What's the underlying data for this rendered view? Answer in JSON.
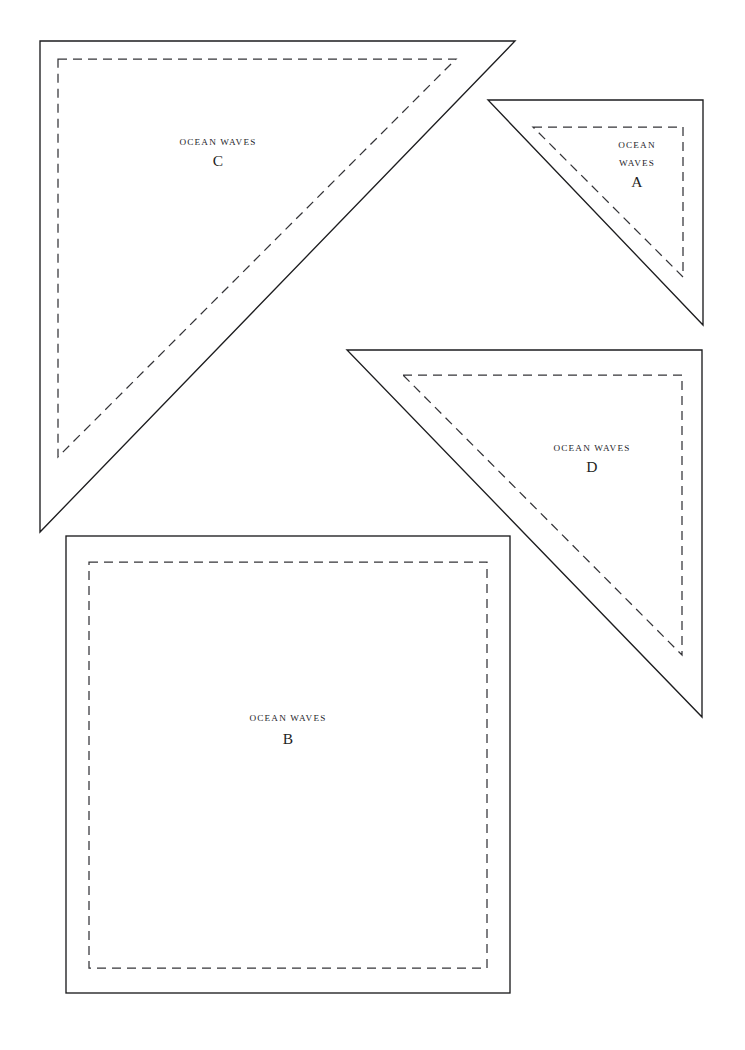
{
  "document": {
    "type": "quilt-template-sheet",
    "pattern_name": "OCEAN WAVES",
    "background_color": "#ffffff",
    "cut_line_color": "#1d1d1f",
    "seam_line_color": "#343438",
    "width": 745,
    "height": 1050
  },
  "pieces": [
    {
      "id": "C",
      "shape": "right-triangle",
      "pattern_label": "OCEAN WAVES",
      "letter": "C",
      "label_lines": [
        "OCEAN WAVES"
      ],
      "label_layout": "single-line",
      "orientation": "right-angle-top-left",
      "cut_points": "40,41 515,41 40,532",
      "seam_points": "58,59 456,59 58,457",
      "label_x": 218,
      "label_title_y": 145,
      "label_letter_y": 166
    },
    {
      "id": "A",
      "shape": "right-triangle",
      "pattern_label": "OCEAN WAVES",
      "letter": "A",
      "label_lines": [
        "OCEAN",
        "WAVES"
      ],
      "label_layout": "two-line",
      "orientation": "right-angle-top-right",
      "cut_points": "488,100 703,100 703,325",
      "seam_points": "533,127 683,127 683,277",
      "label_x": 637,
      "label_title_y": 148,
      "label_title_y2": 166,
      "label_letter_y": 187
    },
    {
      "id": "D",
      "shape": "right-triangle",
      "pattern_label": "OCEAN WAVES",
      "letter": "D",
      "label_lines": [
        "OCEAN WAVES"
      ],
      "label_layout": "single-line",
      "orientation": "right-angle-top-right",
      "cut_points": "347,350 702,350 702,717",
      "seam_points": "403,375 682,375 682,655",
      "label_x": 592,
      "label_title_y": 451,
      "label_letter_y": 472
    },
    {
      "id": "B",
      "shape": "square",
      "pattern_label": "OCEAN WAVES",
      "letter": "B",
      "label_lines": [
        "OCEAN WAVES"
      ],
      "label_layout": "single-line",
      "cut_rect": {
        "x": 66,
        "y": 536,
        "width": 444,
        "height": 457
      },
      "seam_rect": {
        "x": 89,
        "y": 562,
        "width": 398,
        "height": 406
      },
      "label_x": 288,
      "label_title_y": 721,
      "label_letter_y": 744
    }
  ]
}
